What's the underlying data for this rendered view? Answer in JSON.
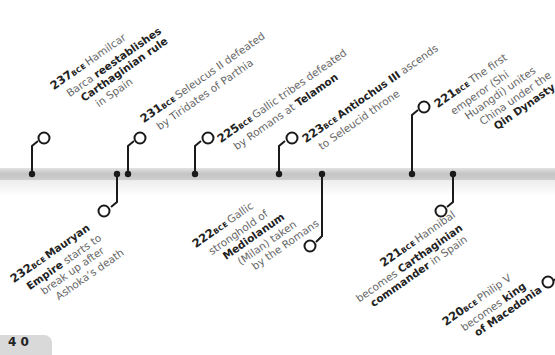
{
  "timeline": {
    "bar_color": "#c8c8c8",
    "line_color": "#1a1a1a",
    "era_suffix": "BCE",
    "events": [
      {
        "id": "e237",
        "year": "237",
        "position": "above",
        "parts": [
          {
            "t": " Hamilcar",
            "b": false
          },
          {
            "t": "Barca ",
            "b": false
          },
          {
            "t": "reestablishes",
            "b": true
          },
          {
            "t": "Carthaginian rule",
            "b": true
          },
          {
            "t": "in Spain",
            "b": false
          }
        ],
        "lines": [
          [
            " Hamilcar"
          ],
          [
            "Barca ",
            "<b>reestablishes</b>"
          ],
          [
            "<b>Carthaginian rule</b>"
          ],
          [
            "in Spain"
          ]
        ]
      },
      {
        "id": "e232",
        "year": "232",
        "position": "below"
      },
      {
        "id": "e231",
        "year": "231",
        "position": "above"
      },
      {
        "id": "e225",
        "year": "225",
        "position": "above"
      },
      {
        "id": "e223",
        "year": "223",
        "position": "above"
      },
      {
        "id": "e222",
        "year": "222",
        "position": "below"
      },
      {
        "id": "e221a",
        "year": "221",
        "position": "above"
      },
      {
        "id": "e221b",
        "year": "221",
        "position": "below"
      },
      {
        "id": "e220",
        "year": "220",
        "position": "below"
      }
    ],
    "text": {
      "e237": {
        "l1": "Hamilcar",
        "l2a": "Barca ",
        "l2b": "reestablishes",
        "l3": "Carthaginian rule",
        "l4": "in Spain"
      },
      "e232": {
        "l1b": "Mauryan",
        "l2b": "Empire",
        "l2a": " starts to",
        "l3": "break up after",
        "l4": "Ashoka’s death"
      },
      "e231": {
        "l1": "Seleucus II defeated",
        "l2": "by Tiridates of Parthia"
      },
      "e225": {
        "l1": "Gallic tribes defeated",
        "l2a": "by Romans at ",
        "l2b": "Telamon"
      },
      "e223": {
        "l1b": "Antiochus III",
        "l1a": " ascends",
        "l2": "to Seleucid throne"
      },
      "e222": {
        "l1": "Gallic",
        "l2": "stronghold of",
        "l3b": "Mediolanum",
        "l4": "(Milan) taken",
        "l5": "by the Romans"
      },
      "e221a": {
        "l1": "The first",
        "l2": "emperor (Shi",
        "l3": "Huangdi) unites",
        "l4": "China under the",
        "l5b": "Qin Dynasty"
      },
      "e221b": {
        "l1": "Hannibal",
        "l2a": "becomes ",
        "l2b": "Carthaginian",
        "l3b": "commander",
        "l3a": " in Spain"
      },
      "e220": {
        "l1": "Philip V",
        "l2a": "becomes ",
        "l2b": "king",
        "l3b": "of Macedonia"
      }
    }
  },
  "page_tab": {
    "label": "4 0"
  }
}
